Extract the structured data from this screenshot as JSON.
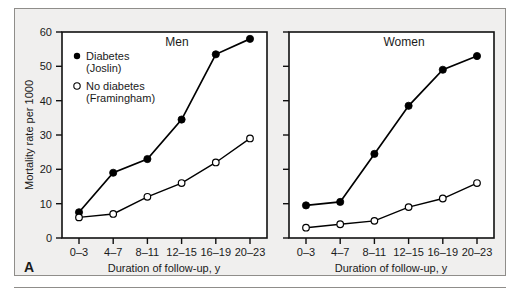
{
  "figure": {
    "panel_letter": "A",
    "background_color": "#f0efee",
    "line_color": "#000000",
    "border_color": "#8f8d8a"
  },
  "legend": {
    "position": "top-left of Men panel",
    "entries": [
      {
        "marker": "filled-circle",
        "line1": "Diabetes",
        "line2": "(Joslin)"
      },
      {
        "marker": "open-circle",
        "line1": "No diabetes",
        "line2": "(Framingham)"
      }
    ]
  },
  "chart_data": [
    {
      "type": "line",
      "title": "Men",
      "xlabel": "Duration of follow-up, y",
      "ylabel": "Mortality rate per 1000",
      "categories": [
        "0–3",
        "4–7",
        "8–11",
        "12–15",
        "16–19",
        "20–23"
      ],
      "ylim": [
        0,
        60
      ],
      "yticks": [
        0,
        10,
        20,
        30,
        40,
        50,
        60
      ],
      "grid": false,
      "legend_position": "upper-left",
      "series": [
        {
          "name": "Diabetes (Joslin)",
          "marker": "filled-circle",
          "values": [
            7.5,
            19,
            23,
            34.5,
            53.5,
            58
          ]
        },
        {
          "name": "No diabetes (Framingham)",
          "marker": "open-circle",
          "values": [
            6,
            7,
            12,
            16,
            22,
            29
          ]
        }
      ]
    },
    {
      "type": "line",
      "title": "Women",
      "xlabel": "Duration of follow-up, y",
      "ylabel": "Mortality rate per 1000",
      "categories": [
        "0–3",
        "4–7",
        "8–11",
        "12–15",
        "16–19",
        "20–23"
      ],
      "ylim": [
        0,
        60
      ],
      "yticks": [
        0,
        10,
        20,
        30,
        40,
        50,
        60
      ],
      "grid": false,
      "legend_position": "none",
      "series": [
        {
          "name": "Diabetes (Joslin)",
          "marker": "filled-circle",
          "values": [
            9.5,
            10.5,
            24.5,
            38.5,
            49,
            53
          ]
        },
        {
          "name": "No diabetes (Framingham)",
          "marker": "open-circle",
          "values": [
            3,
            4,
            5,
            9,
            11.5,
            16
          ]
        }
      ]
    }
  ]
}
